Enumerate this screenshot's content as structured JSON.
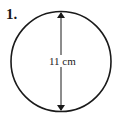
{
  "problem": {
    "number": "1.",
    "dimension_label": "11 cm",
    "shape": "circle",
    "measurement": "diameter"
  },
  "colors": {
    "stroke": "#1a1a1a",
    "background": "#ffffff"
  }
}
